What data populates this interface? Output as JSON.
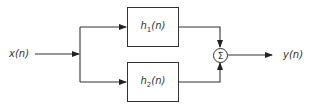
{
  "diagram": {
    "type": "block-diagram",
    "input": {
      "label": "x(n)"
    },
    "output": {
      "label": "y(n)"
    },
    "blocks": [
      {
        "id": "h1",
        "label_main": "h",
        "label_sub": "1",
        "label_arg": "(n)"
      },
      {
        "id": "h2",
        "label_main": "h",
        "label_sub": "2",
        "label_arg": "(n)"
      }
    ],
    "summer": {
      "symbol": "Σ"
    },
    "edges": [
      {
        "from": "x(n)",
        "to": "split"
      },
      {
        "from": "split",
        "to": "h1"
      },
      {
        "from": "split",
        "to": "h2"
      },
      {
        "from": "h1",
        "to": "summer"
      },
      {
        "from": "h2",
        "to": "summer"
      },
      {
        "from": "summer",
        "to": "y(n)"
      }
    ],
    "colors": {
      "stroke": "#333333",
      "background": "#ffffff"
    }
  }
}
